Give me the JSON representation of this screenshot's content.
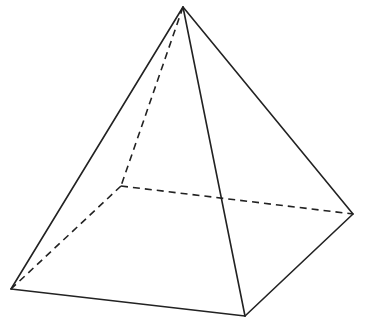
{
  "diagram": {
    "type": "square-pyramid",
    "stroke_color": "#222222",
    "background": "#ffffff",
    "vertices": {
      "apex": [
        183,
        7
      ],
      "front_left": [
        11,
        289
      ],
      "front_right": [
        245,
        316
      ],
      "back_right": [
        353,
        214
      ],
      "back_left_hidden": [
        121,
        186
      ]
    },
    "visible_edges": [
      [
        "apex",
        "front_left"
      ],
      [
        "apex",
        "front_right"
      ],
      [
        "apex",
        "back_right"
      ],
      [
        "front_left",
        "front_right"
      ],
      [
        "front_right",
        "back_right"
      ]
    ],
    "hidden_edges": [
      [
        "apex",
        "back_left_hidden"
      ],
      [
        "back_left_hidden",
        "front_left"
      ],
      [
        "back_left_hidden",
        "back_right"
      ]
    ]
  }
}
